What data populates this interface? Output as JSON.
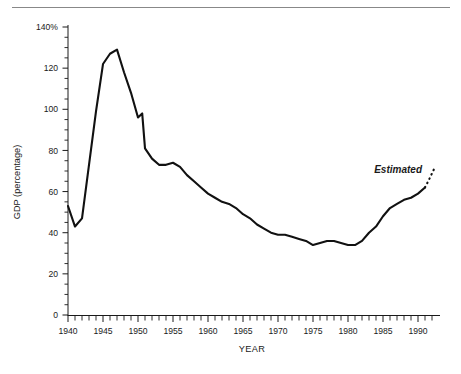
{
  "figure": {
    "top_rule": true,
    "background": "#ffffff",
    "line_color": "#111111",
    "axis_color": "#1a1a1a"
  },
  "chart_data": {
    "type": "line",
    "title": "",
    "xlabel": "YEAR",
    "ylabel": "GDP (percentage)",
    "xlim": [
      1940,
      1992.8
    ],
    "ylim": [
      0,
      140
    ],
    "grid": false,
    "legend": null,
    "y_tick_labels": [
      "140%",
      "120",
      "100",
      "80",
      "60",
      "40",
      "20",
      "0"
    ],
    "y_ticks": [
      140,
      120,
      100,
      80,
      60,
      40,
      20,
      0
    ],
    "y_minor_tick_step": 5,
    "x_tick_labels": [
      "1940",
      "1945",
      "1950",
      "1955",
      "1960",
      "1965",
      "1970",
      "1975",
      "1980",
      "1985",
      "1990"
    ],
    "x_ticks": [
      1940,
      1945,
      1950,
      1955,
      1960,
      1965,
      1970,
      1975,
      1980,
      1985,
      1990
    ],
    "x_minor_tick_step": 1,
    "annotations": [
      {
        "text": "Estimated",
        "x": 1991.0,
        "y": 70.0,
        "style": "italic"
      }
    ],
    "series": [
      {
        "name": "GDP percentage",
        "style": "solid",
        "x": [
          1940,
          1941,
          1942,
          1943,
          1944,
          1945,
          1946,
          1947,
          1948,
          1949,
          1950,
          1950.6,
          1951,
          1952,
          1953,
          1954,
          1955,
          1956,
          1957,
          1958,
          1959,
          1960,
          1961,
          1962,
          1963,
          1964,
          1965,
          1966,
          1967,
          1968,
          1969,
          1970,
          1971,
          1972,
          1973,
          1974,
          1975,
          1976,
          1977,
          1978,
          1979,
          1980,
          1981,
          1982,
          1983,
          1984,
          1985,
          1986,
          1987,
          1988,
          1989,
          1990,
          1991
        ],
        "y": [
          53,
          43,
          47,
          73,
          99,
          122,
          127,
          129,
          118,
          108,
          96,
          98,
          81,
          76,
          73,
          73,
          74,
          72,
          68,
          65,
          62,
          59,
          57,
          55,
          54,
          52,
          49,
          47,
          44,
          42,
          40,
          39,
          39,
          38,
          37,
          36,
          34,
          35,
          36,
          36,
          35,
          34,
          34,
          36,
          40,
          43,
          48,
          52,
          54,
          56,
          57,
          59,
          62
        ],
        "comment": "values read from axis as percentage of GDP"
      },
      {
        "name": "Estimated projection",
        "style": "dotted",
        "x": [
          1991,
          1991.6,
          1992.3
        ],
        "y": [
          62,
          66,
          71
        ]
      }
    ]
  },
  "labels": {
    "y_axis_title": "GDP (percentage)",
    "x_axis_title": "YEAR",
    "estimated": "Estimated"
  }
}
